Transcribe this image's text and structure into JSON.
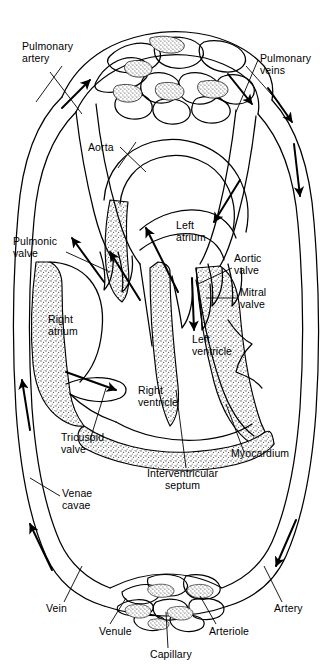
{
  "figure": {
    "type": "anatomical-diagram",
    "width": 333,
    "height": 666,
    "background_color": "#ffffff",
    "line_color": "#000000",
    "myocardium_fill": "#d8d8d8",
    "capillary_fill": "#bdbdbd"
  },
  "labels": {
    "pulmonary_artery": "Pulmonary\nartery",
    "pulmonary_veins": "Pulmonary\nveins",
    "aorta": "Aorta",
    "left_atrium": "Left\natrium",
    "aortic_valve": "Aortic\nvalve",
    "mitral_valve": "Mitral\nvalve",
    "pulmonic_valve": "Pulmonic\nvalve",
    "right_atrium": "Right\natrium",
    "left_ventricle": "Left\nventricle",
    "right_ventricle": "Right\nventricle",
    "tricuspid_valve": "Tricuspid\nvalve",
    "myocardium": "Myocardium",
    "interventricular_septum": "Interventricular\nseptum",
    "venae_cavae": "Venae\ncavae",
    "vein": "Vein",
    "venule": "Venule",
    "capillary": "Capillary",
    "arteriole": "Arteriole",
    "artery": "Artery"
  },
  "label_list": [
    {
      "key": "pulmonary_artery",
      "text": "Pulmonary\nartery",
      "x": 22,
      "y": 42,
      "align": "left"
    },
    {
      "key": "pulmonary_veins",
      "text": "Pulmonary\nveins",
      "x": 260,
      "y": 54,
      "align": "left"
    },
    {
      "key": "aorta",
      "text": "Aorta",
      "x": 88,
      "y": 142,
      "align": "left"
    },
    {
      "key": "left_atrium",
      "text": "Left\natrium",
      "x": 176,
      "y": 221,
      "align": "left"
    },
    {
      "key": "pulmonic_valve",
      "text": "Pulmonic\nvalve",
      "x": 14,
      "y": 237,
      "align": "left"
    },
    {
      "key": "aortic_valve",
      "text": "Aortic\nvalve",
      "x": 234,
      "y": 254,
      "align": "left"
    },
    {
      "key": "mitral_valve",
      "text": "Mitral\nvalve",
      "x": 240,
      "y": 288,
      "align": "left"
    },
    {
      "key": "right_atrium",
      "text": "Right\natrium",
      "x": 48,
      "y": 315,
      "align": "left"
    },
    {
      "key": "left_ventricle",
      "text": "Left\nventricle",
      "x": 192,
      "y": 335,
      "align": "left"
    },
    {
      "key": "right_ventricle",
      "text": "Right\nventricle",
      "x": 138,
      "y": 386,
      "align": "left"
    },
    {
      "key": "tricuspid_valve",
      "text": "Tricuspid\nvalve",
      "x": 62,
      "y": 433,
      "align": "left"
    },
    {
      "key": "myocardium",
      "text": "Myocardium",
      "x": 231,
      "y": 449,
      "align": "left"
    },
    {
      "key": "interventricular_septum",
      "text": "Interventricular\nseptum",
      "x": 148,
      "y": 469,
      "align": "left"
    },
    {
      "key": "venae_cavae",
      "text": "Venae\ncavae",
      "x": 62,
      "y": 489,
      "align": "left"
    },
    {
      "key": "vein",
      "text": "Vein",
      "x": 46,
      "y": 604,
      "align": "left"
    },
    {
      "key": "venule",
      "text": "Venule",
      "x": 99,
      "y": 627,
      "align": "left"
    },
    {
      "key": "arteriole",
      "text": "Arteriole",
      "x": 209,
      "y": 627,
      "align": "left"
    },
    {
      "key": "artery",
      "text": "Artery",
      "x": 274,
      "y": 604,
      "align": "left"
    },
    {
      "key": "capillary",
      "text": "Capillary",
      "x": 150,
      "y": 650,
      "align": "left"
    }
  ],
  "flow_arrows": [
    {
      "name": "pulmonary-artery-flow",
      "direction": "up-right",
      "region": "upper-left"
    },
    {
      "name": "pulmonary-vein-flow",
      "direction": "down-right",
      "region": "upper-right"
    },
    {
      "name": "right-ventricle-outflow",
      "direction": "up-left",
      "region": "pulmonic-valve"
    },
    {
      "name": "right-atrium-outflow",
      "direction": "up",
      "region": "mid-left"
    },
    {
      "name": "left-atrium-outflow",
      "direction": "down",
      "region": "mitral"
    },
    {
      "name": "tricuspid-inflow",
      "direction": "down-right",
      "region": "right-atrium"
    },
    {
      "name": "venae-cavae-return",
      "direction": "up",
      "region": "lower-left"
    },
    {
      "name": "vein-return",
      "direction": "up-left",
      "region": "bottom-left"
    },
    {
      "name": "aorta-outflow",
      "direction": "down",
      "region": "right-outer"
    },
    {
      "name": "artery-flow",
      "direction": "down-left",
      "region": "bottom-right"
    }
  ]
}
